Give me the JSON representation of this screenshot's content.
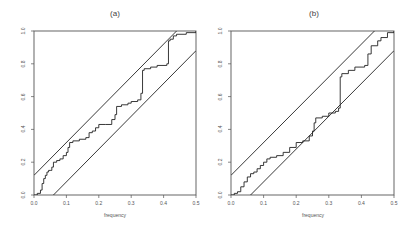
{
  "chart_data": [
    {
      "type": "line",
      "title": "(a)",
      "xlabel": "frequency",
      "ylabel": "",
      "xlim": [
        0.0,
        0.5
      ],
      "ylim": [
        0.0,
        1.0
      ],
      "xticks": [
        "0.0",
        "0.1",
        "0.2",
        "0.3",
        "0.4",
        "0.5"
      ],
      "yticks": [
        "0.0",
        "0.2",
        "0.4",
        "0.6",
        "0.8",
        "1.0"
      ],
      "grid": false,
      "legend": null,
      "series": [
        {
          "name": "cumulative periodogram",
          "step": true,
          "x": [
            0.0,
            0.01,
            0.02,
            0.025,
            0.03,
            0.035,
            0.04,
            0.045,
            0.05,
            0.055,
            0.06,
            0.07,
            0.08,
            0.09,
            0.1,
            0.105,
            0.11,
            0.12,
            0.14,
            0.16,
            0.17,
            0.18,
            0.19,
            0.2,
            0.22,
            0.24,
            0.25,
            0.255,
            0.27,
            0.29,
            0.3,
            0.32,
            0.33,
            0.335,
            0.34,
            0.36,
            0.38,
            0.41,
            0.415,
            0.42,
            0.43,
            0.44,
            0.47,
            0.5
          ],
          "y": [
            0.0,
            0.01,
            0.03,
            0.07,
            0.1,
            0.12,
            0.14,
            0.15,
            0.15,
            0.17,
            0.2,
            0.21,
            0.22,
            0.24,
            0.26,
            0.29,
            0.32,
            0.33,
            0.34,
            0.35,
            0.38,
            0.39,
            0.41,
            0.43,
            0.43,
            0.46,
            0.49,
            0.54,
            0.55,
            0.56,
            0.57,
            0.58,
            0.62,
            0.76,
            0.77,
            0.78,
            0.79,
            0.8,
            0.94,
            0.95,
            0.97,
            0.98,
            0.99,
            1.0
          ]
        },
        {
          "name": "upper band",
          "x": [
            0.0,
            0.44
          ],
          "y": [
            0.12,
            1.0
          ]
        },
        {
          "name": "lower band",
          "x": [
            0.06,
            0.5
          ],
          "y": [
            0.0,
            0.88
          ]
        }
      ]
    },
    {
      "type": "line",
      "title": "(b)",
      "xlabel": "frequency",
      "ylabel": "",
      "xlim": [
        0.0,
        0.5
      ],
      "ylim": [
        0.0,
        1.0
      ],
      "xticks": [
        "0.0",
        "0.1",
        "0.2",
        "0.3",
        "0.4",
        "0.5"
      ],
      "yticks": [
        "0.0",
        "0.2",
        "0.4",
        "0.6",
        "0.8",
        "1.0"
      ],
      "grid": false,
      "legend": null,
      "series": [
        {
          "name": "cumulative periodogram",
          "step": true,
          "x": [
            0.0,
            0.01,
            0.02,
            0.03,
            0.04,
            0.05,
            0.06,
            0.07,
            0.08,
            0.09,
            0.1,
            0.11,
            0.12,
            0.14,
            0.16,
            0.18,
            0.2,
            0.22,
            0.23,
            0.24,
            0.25,
            0.255,
            0.26,
            0.28,
            0.3,
            0.32,
            0.33,
            0.335,
            0.34,
            0.36,
            0.38,
            0.41,
            0.42,
            0.43,
            0.45,
            0.46,
            0.48,
            0.5
          ],
          "y": [
            0.0,
            0.01,
            0.02,
            0.05,
            0.08,
            0.11,
            0.13,
            0.14,
            0.16,
            0.18,
            0.2,
            0.22,
            0.23,
            0.24,
            0.26,
            0.29,
            0.32,
            0.33,
            0.33,
            0.36,
            0.39,
            0.44,
            0.47,
            0.48,
            0.5,
            0.51,
            0.53,
            0.72,
            0.74,
            0.76,
            0.78,
            0.79,
            0.86,
            0.91,
            0.94,
            0.96,
            0.99,
            1.0
          ]
        },
        {
          "name": "upper band",
          "x": [
            0.0,
            0.44
          ],
          "y": [
            0.12,
            1.0
          ]
        },
        {
          "name": "lower band",
          "x": [
            0.06,
            0.5
          ],
          "y": [
            0.0,
            0.88
          ]
        }
      ]
    }
  ],
  "panels": [
    {
      "title": "(a)",
      "xlabel": "frequency"
    },
    {
      "title": "(b)",
      "xlabel": "frequency"
    }
  ],
  "ticks": {
    "x": [
      "0.0",
      "0.1",
      "0.2",
      "0.3",
      "0.4",
      "0.5"
    ],
    "y": [
      "0.0",
      "0.2",
      "0.4",
      "0.6",
      "0.8",
      "1.0"
    ]
  },
  "colors": {
    "line": "#222222",
    "axis": "#555555"
  }
}
